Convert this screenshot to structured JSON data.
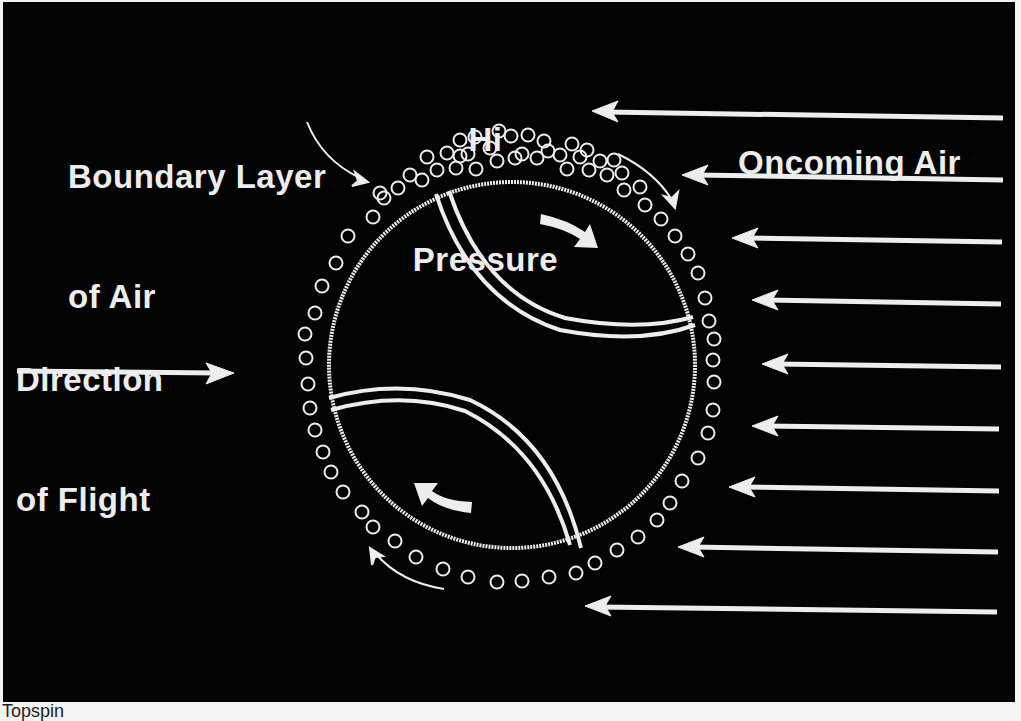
{
  "diagram": {
    "caption": "Topspin",
    "labels": {
      "boundary_layer_line1": "Boundary Layer",
      "boundary_layer_line2": "of Air",
      "hi_pressure_line1": "Hi",
      "hi_pressure_line2": "Pressure",
      "oncoming_air": "Oncoming Air",
      "direction_line1": "Direction",
      "direction_line2": "of Flight"
    },
    "colors": {
      "background": "#030303",
      "foreground": "#ededed",
      "page": "#f4f4f4"
    },
    "ball": {
      "cx": 512,
      "cy": 365,
      "r": 183,
      "spin": "topspin (clockwise)"
    },
    "oncoming_air_arrows": [
      {
        "y": 112,
        "x_start": 1003,
        "x_end": 592
      },
      {
        "y": 178,
        "x_start": 1003,
        "x_end": 682
      },
      {
        "y": 240,
        "x_start": 1002,
        "x_end": 732
      },
      {
        "y": 301,
        "x_start": 1001,
        "x_end": 752
      },
      {
        "y": 364,
        "x_start": 1001,
        "x_end": 762
      },
      {
        "y": 428,
        "x_start": 999,
        "x_end": 752
      },
      {
        "y": 489,
        "x_start": 999,
        "x_end": 729
      },
      {
        "y": 550,
        "x_start": 998,
        "x_end": 678
      },
      {
        "y": 611,
        "x_start": 997,
        "x_end": 585
      }
    ],
    "flight_arrow": {
      "y": 372,
      "x_start": 17,
      "x_end": 233
    }
  }
}
